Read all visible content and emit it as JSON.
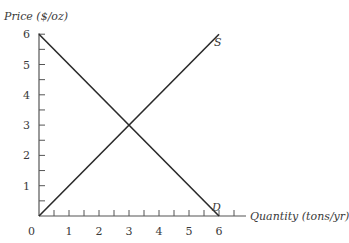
{
  "chart_data": {
    "type": "line",
    "title": "",
    "xlabel": "Quantity (tons/yr)",
    "ylabel": "Price ($/oz)",
    "xlim": [
      0,
      6
    ],
    "ylim": [
      0,
      6
    ],
    "x_ticks": [
      "0",
      "1",
      "2",
      "3",
      "4",
      "5",
      "6"
    ],
    "y_ticks": [
      "1",
      "2",
      "3",
      "4",
      "5",
      "6"
    ],
    "minor_ticks_step": 0.5,
    "grid": false,
    "legend": "none",
    "series": [
      {
        "name": "S",
        "label": "S",
        "x": [
          0,
          6
        ],
        "y": [
          0,
          6
        ]
      },
      {
        "name": "D",
        "label": "D",
        "x": [
          0,
          6
        ],
        "y": [
          6,
          0
        ]
      }
    ],
    "equilibrium": {
      "x": 3,
      "y": 3
    }
  },
  "labels": {
    "y_axis": "Price ($/oz)",
    "x_axis": "Quantity (tons/yr)",
    "supply": "S",
    "demand": "D",
    "origin": "0"
  },
  "colors": {
    "line": "#2a2a2a",
    "text": "#3a3a3a"
  }
}
